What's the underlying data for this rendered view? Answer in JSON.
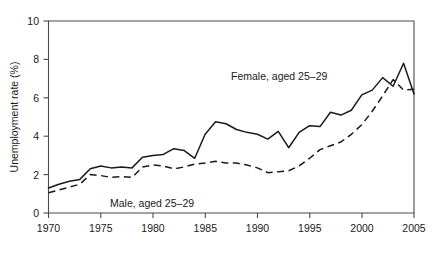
{
  "chart_data": {
    "type": "line",
    "title": "",
    "xlabel": "",
    "ylabel": "Unemployment rate (%)",
    "xlim": [
      1970,
      2005
    ],
    "ylim": [
      0,
      10
    ],
    "xticks": [
      1970,
      1975,
      1980,
      1985,
      1990,
      1995,
      2000,
      2005
    ],
    "yticks": [
      0,
      2,
      4,
      6,
      8,
      10
    ],
    "grid": false,
    "legend_position": "inline-annotation",
    "x": [
      1970,
      1971,
      1972,
      1973,
      1974,
      1975,
      1976,
      1977,
      1978,
      1979,
      1980,
      1981,
      1982,
      1983,
      1984,
      1985,
      1986,
      1987,
      1988,
      1989,
      1990,
      1991,
      1992,
      1993,
      1994,
      1995,
      1996,
      1997,
      1998,
      1999,
      2000,
      2001,
      2002,
      2003,
      2004,
      2005
    ],
    "series": [
      {
        "name": "Female, aged 25–29",
        "style": "solid",
        "annotation": "Female, aged 25–29",
        "values": [
          1.3,
          1.5,
          1.7,
          1.9,
          2.2,
          2.5,
          2.4,
          2.3,
          2.6,
          2.6,
          2.7,
          3.4,
          3.5,
          3.6,
          3.7,
          4.0,
          4.5,
          4.8,
          4.7,
          4.6,
          4.5,
          4.4,
          4.2,
          4.5,
          4.0,
          3.4,
          3.9,
          4.5,
          5.1,
          5.1,
          5.2,
          5.6,
          6.1,
          6.6,
          7.0,
          7.1
        ]
      },
      {
        "name": "Male, aged 25–29",
        "style": "dashed",
        "annotation": "Male, aged 25–29",
        "values": [
          1.1,
          1.2,
          1.4,
          1.6,
          1.8,
          2.2,
          2.2,
          2.1,
          2.2,
          2.2,
          2.2,
          2.5,
          2.6,
          2.5,
          2.3,
          2.5,
          2.6,
          2.7,
          2.7,
          2.7,
          2.6,
          2.5,
          2.4,
          2.3,
          2.2,
          2.1,
          2.2,
          2.4,
          2.7,
          3.1,
          3.4,
          3.8,
          4.2,
          4.6,
          5.1,
          5.6
        ]
      }
    ],
    "series_extended": [
      {
        "name": "Female, aged 25–29",
        "points": [
          [
            1970,
            1.3
          ],
          [
            1971,
            1.5
          ],
          [
            1972,
            1.65
          ],
          [
            1973,
            1.75
          ],
          [
            1974,
            2.3
          ],
          [
            1975,
            2.45
          ],
          [
            1976,
            2.35
          ],
          [
            1977,
            2.4
          ],
          [
            1978,
            2.35
          ],
          [
            1979,
            2.9
          ],
          [
            1980,
            3.0
          ],
          [
            1981,
            3.05
          ],
          [
            1982,
            3.35
          ],
          [
            1983,
            3.25
          ],
          [
            1984,
            2.85
          ],
          [
            1985,
            4.1
          ],
          [
            1986,
            4.75
          ],
          [
            1987,
            4.65
          ],
          [
            1988,
            4.35
          ],
          [
            1989,
            4.2
          ],
          [
            1990,
            4.1
          ],
          [
            1991,
            3.85
          ],
          [
            1992,
            4.25
          ],
          [
            1993,
            3.4
          ],
          [
            1994,
            4.2
          ],
          [
            1995,
            4.55
          ],
          [
            1996,
            4.5
          ],
          [
            1997,
            5.25
          ],
          [
            1998,
            5.1
          ],
          [
            1999,
            5.35
          ],
          [
            2000,
            6.15
          ],
          [
            2001,
            6.4
          ],
          [
            2002,
            7.05
          ],
          [
            2003,
            6.6
          ],
          [
            2004,
            7.8
          ],
          [
            2005,
            6.2
          ]
        ]
      },
      {
        "name": "Male, aged 25–29",
        "points": [
          [
            1970,
            1.05
          ],
          [
            1971,
            1.2
          ],
          [
            1972,
            1.35
          ],
          [
            1973,
            1.5
          ],
          [
            1974,
            2.0
          ],
          [
            1975,
            1.95
          ],
          [
            1976,
            1.85
          ],
          [
            1977,
            1.9
          ],
          [
            1978,
            1.85
          ],
          [
            1979,
            2.4
          ],
          [
            1980,
            2.5
          ],
          [
            1981,
            2.45
          ],
          [
            1982,
            2.3
          ],
          [
            1983,
            2.4
          ],
          [
            1984,
            2.55
          ],
          [
            1985,
            2.6
          ],
          [
            1986,
            2.7
          ],
          [
            1987,
            2.6
          ],
          [
            1988,
            2.6
          ],
          [
            1989,
            2.5
          ],
          [
            1990,
            2.35
          ],
          [
            1991,
            2.1
          ],
          [
            1992,
            2.15
          ],
          [
            1993,
            2.2
          ],
          [
            1994,
            2.45
          ],
          [
            1995,
            2.85
          ],
          [
            1996,
            3.3
          ],
          [
            1997,
            3.5
          ],
          [
            1998,
            3.7
          ],
          [
            1999,
            4.1
          ],
          [
            2000,
            4.6
          ],
          [
            2001,
            5.3
          ],
          [
            2002,
            6.1
          ],
          [
            2003,
            6.95
          ],
          [
            2004,
            6.4
          ],
          [
            2005,
            6.45
          ]
        ]
      }
    ]
  },
  "axes": {
    "y_title": "Unemployment rate (%)",
    "y_tick_labels": [
      "0",
      "2",
      "4",
      "6",
      "8",
      "10"
    ],
    "x_tick_labels": [
      "1970",
      "1975",
      "1980",
      "1985",
      "1990",
      "1995",
      "2000",
      "2005"
    ]
  },
  "annotations": {
    "female": "Female, aged 25–29",
    "male": "Male, aged 25–29"
  },
  "colors": {
    "line": "#1a1a1a",
    "frame": "#4a4a4a",
    "background": "#ffffff"
  }
}
